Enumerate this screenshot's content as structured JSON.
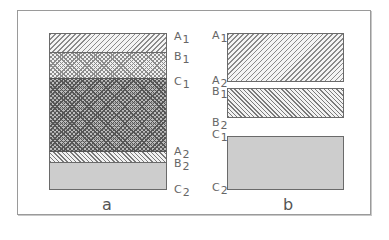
{
  "figure": {
    "panels": [
      {
        "id": "a",
        "caption": "a",
        "layers": [
          {
            "name": "A1-B1",
            "pattern": "forward-hatch",
            "top": 33,
            "bottom": 53
          },
          {
            "name": "B1-C1",
            "pattern": "crosshatch",
            "top": 53,
            "bottom": 78
          },
          {
            "name": "C1-A2",
            "pattern": "dense-crosshatch",
            "top": 78,
            "bottom": 151
          },
          {
            "name": "A2-B2",
            "pattern": "back-hatch",
            "top": 151,
            "bottom": 163
          },
          {
            "name": "B2-C2",
            "pattern": "dots",
            "top": 163,
            "bottom": 189
          }
        ],
        "labels": [
          {
            "letter": "A",
            "sub": "1"
          },
          {
            "letter": "B",
            "sub": "1"
          },
          {
            "letter": "C",
            "sub": "1"
          },
          {
            "letter": "A",
            "sub": "2"
          },
          {
            "letter": "B",
            "sub": "2"
          },
          {
            "letter": "C",
            "sub": "2"
          }
        ]
      },
      {
        "id": "b",
        "caption": "b",
        "rects": [
          {
            "name": "A",
            "pattern": "forward-hatch",
            "top": 33,
            "bottom": 82
          },
          {
            "name": "B",
            "pattern": "back-hatch",
            "top": 88,
            "bottom": 117
          },
          {
            "name": "C",
            "pattern": "dots",
            "top": 136,
            "bottom": 189
          }
        ],
        "labels": [
          {
            "letter": "A",
            "sub": "1"
          },
          {
            "letter": "A",
            "sub": "2"
          },
          {
            "letter": "B",
            "sub": "1"
          },
          {
            "letter": "B",
            "sub": "2"
          },
          {
            "letter": "C",
            "sub": "1"
          },
          {
            "letter": "C",
            "sub": "2"
          }
        ]
      }
    ]
  }
}
